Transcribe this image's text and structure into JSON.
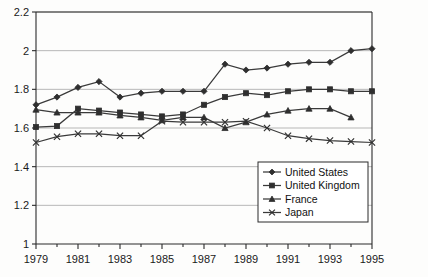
{
  "chart_data": {
    "type": "line",
    "title": "",
    "xlabel": "",
    "ylabel": "",
    "x": [
      1979,
      1980,
      1981,
      1982,
      1983,
      1984,
      1985,
      1986,
      1987,
      1988,
      1989,
      1990,
      1991,
      1992,
      1993,
      1994,
      1995
    ],
    "xlim": [
      1979,
      1995
    ],
    "ylim": [
      1.0,
      2.2
    ],
    "yticks": [
      "1",
      "1.2",
      "1.4",
      "1.6",
      "1.8",
      "2",
      "2.2"
    ],
    "ytick_values": [
      1.0,
      1.2,
      1.4,
      1.6,
      1.8,
      2.0,
      2.2
    ],
    "xticks": [
      "1979",
      "1981",
      "1983",
      "1985",
      "1987",
      "1989",
      "1991",
      "1993",
      "1995"
    ],
    "xtick_values": [
      1979,
      1981,
      1983,
      1985,
      1987,
      1989,
      1991,
      1993,
      1995
    ],
    "grid": true,
    "legend_position": "bottom-right",
    "series": [
      {
        "name": "United States",
        "marker": "diamond",
        "x": [
          1979,
          1980,
          1981,
          1982,
          1983,
          1984,
          1985,
          1986,
          1987,
          1988,
          1989,
          1990,
          1991,
          1992,
          1993,
          1994,
          1995
        ],
        "values": [
          1.72,
          1.76,
          1.81,
          1.84,
          1.76,
          1.78,
          1.79,
          1.79,
          1.79,
          1.93,
          1.9,
          1.91,
          1.93,
          1.94,
          1.94,
          2.0,
          2.01
        ]
      },
      {
        "name": "United Kingdom",
        "marker": "square",
        "x": [
          1979,
          1980,
          1981,
          1982,
          1983,
          1984,
          1985,
          1986,
          1987,
          1988,
          1989,
          1990,
          1991,
          1992,
          1993,
          1994,
          1995
        ],
        "values": [
          1.605,
          1.61,
          1.7,
          1.69,
          1.68,
          1.67,
          1.66,
          1.67,
          1.72,
          1.76,
          1.78,
          1.77,
          1.79,
          1.8,
          1.8,
          1.79,
          1.79
        ]
      },
      {
        "name": "France",
        "marker": "triangle",
        "x": [
          1979,
          1980,
          1981,
          1982,
          1983,
          1984,
          1985,
          1986,
          1987,
          1988,
          1989,
          1990,
          1991,
          1992,
          1993,
          1994
        ],
        "values": [
          1.695,
          1.68,
          1.68,
          1.68,
          1.665,
          1.655,
          1.64,
          1.655,
          1.655,
          1.6,
          1.63,
          1.67,
          1.69,
          1.7,
          1.7,
          1.655
        ]
      },
      {
        "name": "Japan",
        "marker": "cross",
        "x": [
          1979,
          1980,
          1981,
          1982,
          1983,
          1984,
          1985,
          1986,
          1987,
          1988,
          1989,
          1990,
          1991,
          1992,
          1993,
          1994,
          1995
        ],
        "values": [
          1.525,
          1.555,
          1.57,
          1.57,
          1.56,
          1.56,
          1.635,
          1.63,
          1.63,
          1.63,
          1.635,
          1.6,
          1.56,
          1.545,
          1.535,
          1.53,
          1.525
        ]
      }
    ]
  },
  "legend": {
    "items": [
      {
        "label": "United States"
      },
      {
        "label": "United Kingdom"
      },
      {
        "label": "France"
      },
      {
        "label": "Japan"
      }
    ]
  }
}
